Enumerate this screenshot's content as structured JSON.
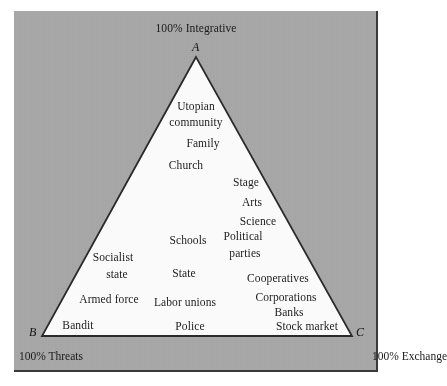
{
  "figure": {
    "type": "ternary-diagram",
    "background_color": "#a9a9a9",
    "triangle_fill": "#fafafa",
    "triangle_stroke": "#2a2a2a",
    "text_color": "#1a1a1a"
  },
  "apex_caption": "100% Integrative",
  "vertices": [
    {
      "id": "A",
      "label": "A",
      "x": 196,
      "y": 57,
      "caption": "100% Integrative"
    },
    {
      "id": "B",
      "label": "B",
      "x": 42,
      "y": 336,
      "caption": "100% Threats"
    },
    {
      "id": "C",
      "label": "C",
      "x": 352,
      "y": 336,
      "caption": "100% Exchange"
    }
  ],
  "axis_captions": {
    "left_bottom": "100% Threats",
    "right_bottom": "100% Exchange",
    "top": "100% Integrative"
  },
  "items": [
    {
      "text": "Utopian",
      "x": 196,
      "y": 100,
      "align": "center"
    },
    {
      "text": "community",
      "x": 196,
      "y": 116,
      "align": "center"
    },
    {
      "text": "Family",
      "x": 203,
      "y": 137,
      "align": "center"
    },
    {
      "text": "Church",
      "x": 186,
      "y": 159,
      "align": "center"
    },
    {
      "text": "Stage",
      "x": 246,
      "y": 176,
      "align": "center"
    },
    {
      "text": "Arts",
      "x": 252,
      "y": 196,
      "align": "center"
    },
    {
      "text": "Science",
      "x": 258,
      "y": 215,
      "align": "center"
    },
    {
      "text": "Schools",
      "x": 188,
      "y": 234,
      "align": "center"
    },
    {
      "text": "Political",
      "x": 243,
      "y": 230,
      "align": "center"
    },
    {
      "text": "parties",
      "x": 245,
      "y": 247,
      "align": "center"
    },
    {
      "text": "Socialist",
      "x": 113,
      "y": 251,
      "align": "center"
    },
    {
      "text": "state",
      "x": 117,
      "y": 268,
      "align": "center"
    },
    {
      "text": "State",
      "x": 184,
      "y": 267,
      "align": "center"
    },
    {
      "text": "Cooperatives",
      "x": 278,
      "y": 272,
      "align": "center"
    },
    {
      "text": "Armed force",
      "x": 109,
      "y": 293,
      "align": "center"
    },
    {
      "text": "Labor unions",
      "x": 185,
      "y": 296,
      "align": "center"
    },
    {
      "text": "Corporations",
      "x": 286,
      "y": 291,
      "align": "center"
    },
    {
      "text": "Banks",
      "x": 289,
      "y": 306,
      "align": "center"
    },
    {
      "text": "Bandit",
      "x": 78,
      "y": 319,
      "align": "center"
    },
    {
      "text": "Police",
      "x": 190,
      "y": 320,
      "align": "center"
    },
    {
      "text": "Stock market",
      "x": 307,
      "y": 320,
      "align": "center"
    }
  ]
}
